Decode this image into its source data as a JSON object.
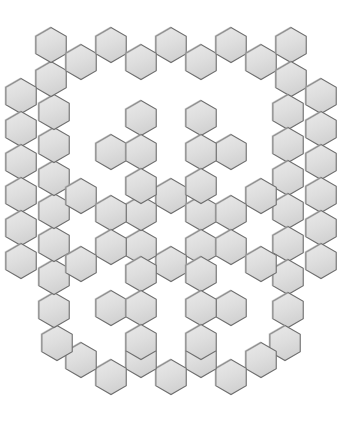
{
  "figure": {
    "canvas_width": 342,
    "canvas_height": 442,
    "background_color": "#ffffff"
  },
  "style": {
    "fill_color": "#dedede",
    "fill_color_light": "#e8e8e8",
    "stroke_color": "#6e6e6e",
    "stroke_width": 1.1,
    "shade_color": "#a8a8a8",
    "hex_width": 34,
    "hex_height": 34
  },
  "geometry": {
    "hex_radius": 17.6,
    "orientation": "pointy-top",
    "col_step": 30.5,
    "row_step": 26.4,
    "origin_x": 171,
    "origin_y": 221
  },
  "chart_data": {
    "type": "scatter",
    "xlabel": "",
    "ylabel": "",
    "xlim": [
      0,
      342
    ],
    "ylim": [
      0,
      442
    ],
    "grid": false,
    "legend": "none",
    "units": "pixels",
    "groups": [
      {
        "name": "outer-ring",
        "count": 46,
        "note": "closed ring of hexagons tracing a rounded hexagonal outline",
        "centers": [
          [
            171,
            45
          ],
          [
            201,
            62
          ],
          [
            231,
            45
          ],
          [
            261,
            62
          ],
          [
            291,
            45
          ],
          [
            291,
            79
          ],
          [
            288,
            112
          ],
          [
            288,
            145
          ],
          [
            288,
            178
          ],
          [
            288,
            211
          ],
          [
            288,
            244
          ],
          [
            288,
            277
          ],
          [
            288,
            310
          ],
          [
            285,
            343
          ],
          [
            261,
            360
          ],
          [
            231,
            377
          ],
          [
            201,
            360
          ],
          [
            171,
            377
          ],
          [
            141,
            360
          ],
          [
            111,
            377
          ],
          [
            81,
            360
          ],
          [
            57,
            343
          ],
          [
            54,
            310
          ],
          [
            54,
            277
          ],
          [
            54,
            244
          ],
          [
            54,
            211
          ],
          [
            54,
            178
          ],
          [
            54,
            145
          ],
          [
            54,
            112
          ],
          [
            51,
            79
          ],
          [
            51,
            45
          ],
          [
            81,
            62
          ],
          [
            111,
            45
          ],
          [
            141,
            62
          ],
          [
            321,
            96
          ],
          [
            321,
            129
          ],
          [
            321,
            162
          ],
          [
            321,
            195
          ],
          [
            321,
            228
          ],
          [
            321,
            261
          ],
          [
            21,
            96
          ],
          [
            21,
            129
          ],
          [
            21,
            162
          ],
          [
            21,
            195
          ],
          [
            21,
            228
          ],
          [
            21,
            261
          ]
        ]
      },
      {
        "name": "center-rosette",
        "count": 6,
        "note": "ring of six hexagons around an empty central cell",
        "centers": [
          [
            171,
            196
          ],
          [
            201,
            213
          ],
          [
            201,
            247
          ],
          [
            171,
            264
          ],
          [
            141,
            247
          ],
          [
            141,
            213
          ]
        ]
      },
      {
        "name": "cluster-top-left",
        "count": 4,
        "note": "Y-shaped cluster",
        "centers": [
          [
            141,
            118
          ],
          [
            111,
            152
          ],
          [
            141,
            152
          ],
          [
            141,
            186
          ]
        ]
      },
      {
        "name": "cluster-top-right",
        "count": 4,
        "note": "Y-shaped cluster, mirrored",
        "centers": [
          [
            201,
            118
          ],
          [
            231,
            152
          ],
          [
            201,
            152
          ],
          [
            201,
            186
          ]
        ]
      },
      {
        "name": "cluster-mid-left",
        "count": 4,
        "note": "zigzag cluster",
        "centers": [
          [
            81,
            196
          ],
          [
            111,
            213
          ],
          [
            111,
            247
          ],
          [
            81,
            264
          ]
        ]
      },
      {
        "name": "cluster-mid-right",
        "count": 4,
        "note": "zigzag cluster, mirrored",
        "centers": [
          [
            261,
            196
          ],
          [
            231,
            213
          ],
          [
            231,
            247
          ],
          [
            261,
            264
          ]
        ]
      },
      {
        "name": "cluster-bottom-left",
        "count": 4,
        "note": "Y-shaped cluster, inverted",
        "centers": [
          [
            141,
            274
          ],
          [
            111,
            308
          ],
          [
            141,
            308
          ],
          [
            141,
            342
          ]
        ]
      },
      {
        "name": "cluster-bottom-right",
        "count": 4,
        "note": "Y-shaped cluster, inverted mirrored",
        "centers": [
          [
            201,
            274
          ],
          [
            231,
            308
          ],
          [
            201,
            308
          ],
          [
            201,
            342
          ]
        ]
      }
    ]
  }
}
